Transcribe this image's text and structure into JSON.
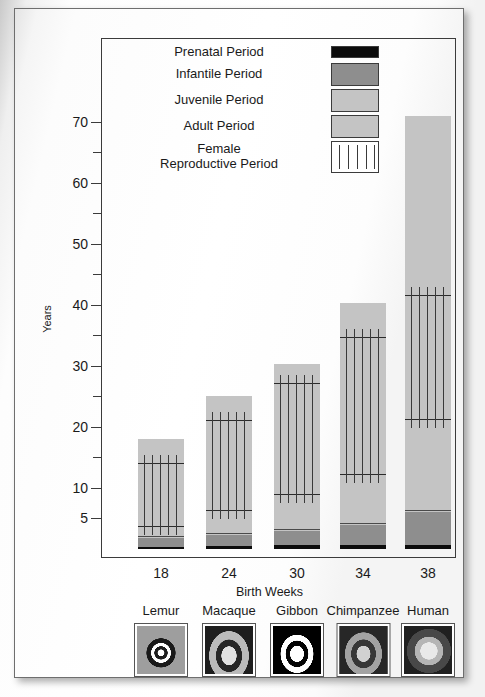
{
  "figure": {
    "y_axis_title": "Years",
    "x_axis_title": "Birth Weeks"
  },
  "legend": {
    "items": [
      {
        "label": "Prenatal Period",
        "swatch": "prenatal-swatch",
        "color": "#0c0c0c"
      },
      {
        "label": "Infantile Period",
        "swatch": "infantile-swatch",
        "color": "#8e8e8e"
      },
      {
        "label": "Juvenile Period",
        "swatch": "juvenile-swatch",
        "color": "#c4c4c4"
      },
      {
        "label": "Adult Period",
        "swatch": "adult-swatch",
        "color": "#c4c4c4"
      },
      {
        "label": "Female\nReproductive Period",
        "label_line1": "Female",
        "label_line2": "Reproductive Period",
        "swatch": "female-reproductive-swatch",
        "color": "#ffffff"
      }
    ]
  },
  "chart_data": {
    "type": "bar",
    "title": "",
    "subtitle": "",
    "xlabel": "Birth Weeks",
    "ylabel": "Years",
    "stacked": true,
    "grid": false,
    "legend_position": "top-center-inside",
    "ylim": [
      0,
      72
    ],
    "yticks": [
      5,
      10,
      15,
      20,
      25,
      30,
      35,
      40,
      45,
      50,
      55,
      60,
      65,
      70
    ],
    "ytick_labels": [
      "5",
      "10",
      "",
      "20",
      "",
      "30",
      "",
      "40",
      "",
      "50",
      "",
      "60",
      "",
      "70"
    ],
    "categories": [
      "18",
      "24",
      "30",
      "34",
      "38"
    ],
    "category_species": [
      "Lemur",
      "Macaque",
      "Gibbon",
      "Chimpanzee",
      "Human"
    ],
    "series": [
      {
        "name": "Prenatal Period",
        "values": [
          0.35,
          0.46,
          0.58,
          0.65,
          0.73
        ]
      },
      {
        "name": "Infantile Period",
        "values": [
          1.45,
          1.85,
          2.4,
          3.35,
          5.3
        ]
      },
      {
        "name": "Juvenile Period",
        "values": [
          1.6,
          3.7,
          5.7,
          8.0,
          15.0
        ]
      },
      {
        "name": "Adult Period",
        "values": [
          14.6,
          19.0,
          21.6,
          28.3,
          50.0
        ]
      }
    ],
    "totals": [
      18.0,
      25.0,
      30.3,
      40.3,
      71.0
    ],
    "segment_boundaries": {
      "Lemur": {
        "prenatal_end": 0.35,
        "infantile_end": 1.8,
        "juvenile_end": 3.4,
        "adult_end": 18.0
      },
      "Macaque": {
        "prenatal_end": 0.46,
        "infantile_end": 2.3,
        "juvenile_end": 6.0,
        "adult_end": 25.0
      },
      "Gibbon": {
        "prenatal_end": 0.58,
        "infantile_end": 3.0,
        "juvenile_end": 8.7,
        "adult_end": 30.3
      },
      "Chimpanzee": {
        "prenatal_end": 0.65,
        "infantile_end": 4.0,
        "juvenile_end": 12.0,
        "adult_end": 40.3
      },
      "Human": {
        "prenatal_end": 0.73,
        "infantile_end": 6.0,
        "juvenile_end": 21.0,
        "adult_end": 71.0
      }
    },
    "female_reproductive_period": [
      {
        "species": "Lemur",
        "start": 3.4,
        "end": 14.0
      },
      {
        "species": "Macaque",
        "start": 6.0,
        "end": 21.0
      },
      {
        "species": "Gibbon",
        "start": 8.7,
        "end": 27.0
      },
      {
        "species": "Chimpanzee",
        "start": 12.0,
        "end": 34.5
      },
      {
        "species": "Human",
        "start": 21.0,
        "end": 41.5
      }
    ]
  },
  "species_strip": [
    {
      "name": "Lemur",
      "thumbnail": "lemur-photo"
    },
    {
      "name": "Macaque",
      "thumbnail": "macaque-photo"
    },
    {
      "name": "Gibbon",
      "thumbnail": "gibbon-photo"
    },
    {
      "name": "Chimpanzee",
      "thumbnail": "chimpanzee-photo"
    },
    {
      "name": "Human",
      "thumbnail": "human-photo"
    }
  ]
}
